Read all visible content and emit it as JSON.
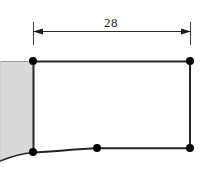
{
  "figure": {
    "type": "structural-frame-diagram",
    "background_color": "#ffffff",
    "line_color": "#1a1a1a",
    "wall_fill_color": "#d9d9d9",
    "wall_edge_color": "#8a8a8a",
    "node_color": "#000000"
  },
  "dimension": {
    "label": "28",
    "line_y": 31,
    "start_x": 33,
    "end_x": 191,
    "extension_top_y": 22,
    "extension_bottom_y": 40,
    "arrow_style": "filled-triangle-inward",
    "label_x": 112,
    "label_y": 20
  },
  "members": {
    "top_beam": {
      "name": "top-beam",
      "from": [
        33,
        61
      ],
      "to": [
        190,
        61
      ],
      "shape": "straight"
    },
    "left_column": {
      "name": "left-column",
      "from": [
        33,
        61
      ],
      "to": [
        33,
        152
      ],
      "shape": "straight"
    },
    "right_column": {
      "name": "right-column",
      "from": [
        190,
        61
      ],
      "to": [
        190,
        148
      ],
      "shape": "straight"
    },
    "bottom_curved_member": {
      "name": "bottom-curved-member",
      "from": [
        33,
        152
      ],
      "through": [
        97,
        148
      ],
      "to": [
        190,
        148
      ],
      "shape": "curved-sagging"
    },
    "curve_tail": {
      "name": "curve-tail-left",
      "from": [
        33,
        152
      ],
      "to": [
        0,
        160
      ],
      "shape": "curved"
    }
  },
  "nodes": [
    {
      "name": "node-top-left",
      "x": 33,
      "y": 61,
      "radius": 4
    },
    {
      "name": "node-top-right",
      "x": 190,
      "y": 61,
      "radius": 4
    },
    {
      "name": "node-bottom-left",
      "x": 33,
      "y": 152,
      "radius": 4
    },
    {
      "name": "node-bottom-mid",
      "x": 97,
      "y": 148,
      "radius": 4
    },
    {
      "name": "node-bottom-right",
      "x": 190,
      "y": 148,
      "radius": 4
    }
  ],
  "wall": {
    "name": "support-wall",
    "x": 0,
    "y": 61,
    "width": 33,
    "height": 98,
    "fill": "#d9d9d9"
  }
}
